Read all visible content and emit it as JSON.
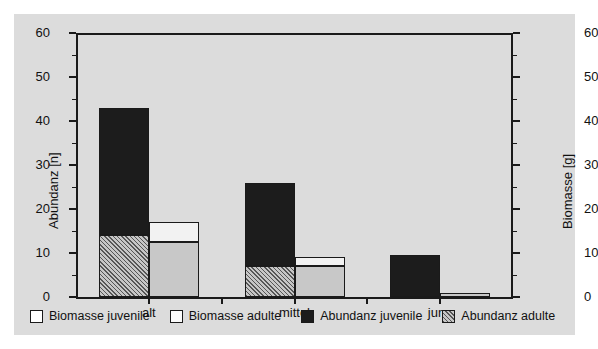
{
  "chart_data": {
    "type": "bar",
    "title": "",
    "subtitle": "",
    "categories": [
      "alt",
      "mittel",
      "jung"
    ],
    "xlabel": "",
    "ylabel": "Abundanz [n]",
    "y2label": "Biomasse [g]",
    "ylim": [
      0,
      60
    ],
    "y2lim": [
      0,
      60
    ],
    "yticks": [
      0,
      10,
      20,
      30,
      40,
      50,
      60
    ],
    "y2ticks": [
      0,
      10,
      20,
      30,
      40,
      50,
      60
    ],
    "grid": false,
    "legend_position": "bottom",
    "stacked": true,
    "series": [
      {
        "name": "Abundanz adulte",
        "axis": "left",
        "values": [
          14,
          7,
          0
        ]
      },
      {
        "name": "Abundanz juvenile",
        "axis": "left",
        "values": [
          29,
          19,
          9.5
        ]
      },
      {
        "name": "Biomasse adulte",
        "axis": "right",
        "values": [
          12.5,
          7,
          1
        ]
      },
      {
        "name": "Biomasse juvenile",
        "axis": "right",
        "values": [
          4.5,
          2,
          0
        ]
      }
    ],
    "totals": {
      "abundanz": [
        43,
        26,
        9.5
      ],
      "biomasse": [
        17,
        9,
        1
      ]
    }
  },
  "axes": {
    "left": {
      "label": "Abundanz [n]",
      "ticks": [
        "0",
        "10",
        "20",
        "30",
        "40",
        "50",
        "60"
      ]
    },
    "right": {
      "label": "Biomasse [g]",
      "ticks": [
        "0",
        "10",
        "20",
        "30",
        "40",
        "50",
        "60"
      ]
    },
    "x": {
      "ticks": [
        "alt",
        "mittel",
        "jung"
      ]
    }
  },
  "legend": {
    "items": [
      {
        "label": "Biomasse juvenile",
        "swatch": "white-square",
        "color": "#ffffff"
      },
      {
        "label": "Biomasse adulte",
        "swatch": "white-square",
        "color": "#fbfbfb"
      },
      {
        "label": "Abundanz juvenile",
        "swatch": "black-square",
        "color": "#1c1c1c"
      },
      {
        "label": "Abundanz adulte",
        "swatch": "hatched-square",
        "color": "#b4b4b4"
      }
    ]
  },
  "colors": {
    "background": "#dcdcdc",
    "page": "#ffffff",
    "ink": "#1a1a1a",
    "abundanz_juvenile": "#1c1c1c",
    "abundanz_adulte": "#b4b4b4",
    "biomasse_juvenile": "#f2f2f2",
    "biomasse_adulte": "#c8c8c8"
  }
}
